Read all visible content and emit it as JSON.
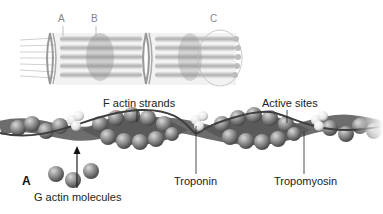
{
  "figure": {
    "top_panel": {
      "description": "Myofibril with thin and thick filaments",
      "labels": {
        "a": "A",
        "b": "B",
        "c": "C"
      }
    },
    "bottom_panel": {
      "panel_letter": "A",
      "labels": {
        "f_actin": "F actin strands",
        "active_sites": "Active sites",
        "g_actin": "G actin molecules",
        "troponin": "Troponin",
        "tropomyosin": "Tropomyosin"
      }
    },
    "colors": {
      "sphere": "#7a7a7a",
      "sphere_highlight": "#c8c8c8",
      "troponin": "#e8e8e8",
      "strand": "#555555",
      "background": "#ffffff"
    }
  }
}
